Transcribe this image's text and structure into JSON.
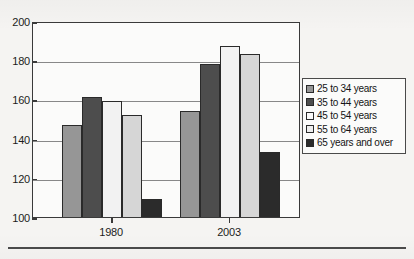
{
  "chart_data": {
    "type": "bar",
    "title": "",
    "xlabel": "",
    "ylabel": "",
    "categories": [
      "1980",
      "2003"
    ],
    "ylim": [
      100,
      200
    ],
    "yticks": [
      100,
      120,
      140,
      160,
      180,
      200
    ],
    "ytick_labels": [
      "100",
      "120",
      "140",
      "160",
      "180",
      "200"
    ],
    "grid": true,
    "legend_position": "right",
    "series": [
      {
        "name": "25 to 34 years",
        "values": [
          147,
          154
        ],
        "color": "#969696"
      },
      {
        "name": "35 to 44 years",
        "values": [
          161,
          178
        ],
        "color": "#4d4d4d"
      },
      {
        "name": "45 to 54 years",
        "values": [
          159,
          187
        ],
        "color": "#f2f2f2"
      },
      {
        "name": "55 to 64 years",
        "values": [
          152,
          183
        ],
        "color": "#d6d6d6"
      },
      {
        "name": "65 years and over",
        "values": [
          109,
          133
        ],
        "color": "#2b2b2b"
      }
    ]
  },
  "axes": {
    "y_tick_labels": [
      "200",
      "180",
      "160",
      "140",
      "120",
      "100"
    ],
    "x_tick_labels": [
      "1980",
      "2003"
    ]
  },
  "legend": {
    "items": [
      {
        "label": "25 to 34 years",
        "swatch": "#969696"
      },
      {
        "label": "35 to 44 years",
        "swatch": "#4d4d4d"
      },
      {
        "label": "45 to 54 years",
        "swatch": "#fafafa"
      },
      {
        "label": "55 to 64 years",
        "swatch": "#ededed"
      },
      {
        "label": "65 years and over",
        "swatch": "#2b2b2b"
      }
    ]
  }
}
